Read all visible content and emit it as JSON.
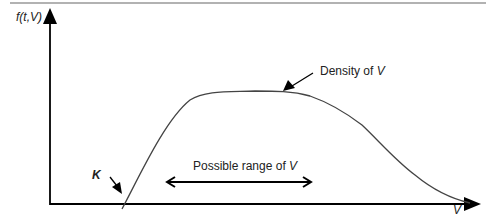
{
  "figure": {
    "y_axis_label": "f(t,V)",
    "x_axis_label": "V",
    "curve_annotation": {
      "text": "Density of ",
      "var": "V"
    },
    "range_annotation": {
      "text": "Possible range of ",
      "var": "V"
    },
    "threshold_label": "K",
    "colors": {
      "line": "#444444",
      "axis": "#000000",
      "border": "#999999"
    }
  }
}
